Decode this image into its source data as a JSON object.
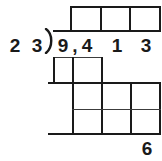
{
  "worksheet": {
    "type": "long-division",
    "divisor": "23",
    "divisor_digits": [
      "2",
      "3"
    ],
    "dividend": "9,413",
    "dividend_digits": [
      "9",
      ",",
      "4",
      "1",
      "3"
    ],
    "remainder": "6",
    "quotient_boxes": [
      "",
      "",
      ""
    ],
    "first_subtraction_boxes": [
      "",
      ""
    ],
    "second_row_boxes": [
      "",
      "",
      ""
    ],
    "third_row_boxes": [
      "",
      "",
      ""
    ],
    "colors": {
      "ink": "#1a1a1a",
      "grid": "#3c3c3c",
      "paper": "#ffffff"
    }
  }
}
